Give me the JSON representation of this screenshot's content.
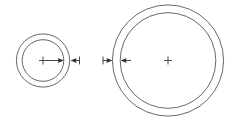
{
  "figure": {
    "title": "Two concentric ring cross-sections with radial dimension arrows",
    "kind": "technical-line-drawing",
    "canvas": {
      "width": 236,
      "height": 121,
      "background": "#ffffff"
    },
    "stroke_color": "#565656",
    "dimension_color": "#2e2e2e",
    "center_mark_color": "#3a3a3a",
    "line_width": 0.9
  },
  "chart_data": {
    "type": "diagram",
    "title": "Two concentric ring cross-sections with radial dimension arrows",
    "xlabel": "",
    "ylabel": "",
    "shapes": [
      {
        "name": "small-ring",
        "role": "left-figure",
        "center": {
          "x": 43,
          "y": 60.5
        },
        "outer_radius": 27,
        "inner_radius": 21,
        "stroke": "#565656"
      },
      {
        "name": "large-ring",
        "role": "right-figure",
        "center": {
          "x": 168,
          "y": 60.5
        },
        "outer_radius": 56,
        "inner_radius": 48,
        "stroke": "#565656"
      }
    ],
    "center_marks": [
      {
        "name": "small-ring-center-cross",
        "x": 43,
        "y": 60.5,
        "arm": 4
      },
      {
        "name": "large-ring-center-cross",
        "x": 168,
        "y": 60.5,
        "arm": 4
      }
    ],
    "dimension_arrows": [
      {
        "name": "small-inner-radius-arrow",
        "from": {
          "x": 47,
          "y": 60.5
        },
        "to": {
          "x": 64,
          "y": 60.5
        },
        "direction": "right",
        "heads": "end",
        "describes": "inner radius of small ring"
      },
      {
        "name": "small-outer-gap-arrow",
        "from": {
          "x": 79,
          "y": 60.5
        },
        "to": {
          "x": 70.5,
          "y": 60.5
        },
        "direction": "left",
        "heads": "end",
        "describes": "outer edge of small ring, gap callout"
      },
      {
        "name": "large-outer-gap-arrow",
        "from": {
          "x": 103,
          "y": 60.5
        },
        "to": {
          "x": 112.5,
          "y": 60.5
        },
        "direction": "right",
        "heads": "end",
        "describes": "outer edge of large ring, gap callout"
      },
      {
        "name": "large-wall-thickness-arrow",
        "from": {
          "x": 131,
          "y": 60.5
        },
        "to": {
          "x": 120.5,
          "y": 60.5
        },
        "direction": "left",
        "heads": "end",
        "describes": "inner edge of large ring, wall thickness callout"
      }
    ],
    "labels": [],
    "legend": [],
    "grid": false
  }
}
